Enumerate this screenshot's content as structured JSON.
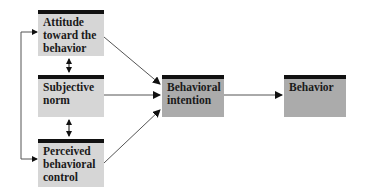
{
  "diagram": {
    "nodes": [
      {
        "id": "attitude",
        "label": "Attitude toward the behavior"
      },
      {
        "id": "subjective_norm",
        "label": "Subjective norm"
      },
      {
        "id": "perceived_control",
        "label": "Perceived behavioral control"
      },
      {
        "id": "intention",
        "label": "Behavioral intention"
      },
      {
        "id": "behavior",
        "label": "Behavior"
      }
    ],
    "edges": [
      {
        "from": "attitude",
        "to": "intention",
        "type": "directed"
      },
      {
        "from": "subjective_norm",
        "to": "intention",
        "type": "directed"
      },
      {
        "from": "perceived_control",
        "to": "intention",
        "type": "directed"
      },
      {
        "from": "intention",
        "to": "behavior",
        "type": "directed"
      },
      {
        "from": "attitude",
        "to": "subjective_norm",
        "type": "bidirectional"
      },
      {
        "from": "subjective_norm",
        "to": "perceived_control",
        "type": "bidirectional"
      },
      {
        "from": "attitude",
        "to": "perceived_control",
        "type": "bidirectional"
      }
    ],
    "colors": {
      "predictor_box": "#d6d6d6",
      "outcome_box": "#ababab",
      "box_top_bar": "#111111",
      "line": "#555555"
    }
  }
}
